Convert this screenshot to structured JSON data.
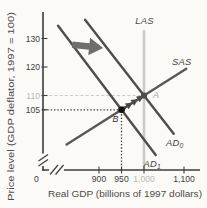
{
  "chart_data": {
    "type": "line",
    "title": "",
    "xlabel": "Real GDP (billions of 1997 dollars)",
    "ylabel": "Price level (GDP deflator, 1997 = 100)",
    "x_axis": {
      "origin_label": "0",
      "has_break": true,
      "ticks": [
        {
          "label": "900",
          "value": 900,
          "color": "#403f3d"
        },
        {
          "label": "950",
          "value": 950,
          "color": "#403f3d"
        },
        {
          "label": "1,000",
          "value": 1000,
          "color": "#b8bab2"
        },
        {
          "label": "1,100",
          "value": 1100,
          "color": "#403f3d"
        }
      ]
    },
    "y_axis": {
      "has_break": true,
      "ticks": [
        {
          "label": "130",
          "value": 130,
          "color": "#403f3d"
        },
        {
          "label": "120",
          "value": 120,
          "color": "#403f3d"
        },
        {
          "label": "110",
          "value": 110,
          "color": "#b8bab2"
        },
        {
          "label": "105",
          "value": 105,
          "color": "#403f3d"
        }
      ]
    },
    "curves": [
      {
        "name": "LAS",
        "label": "LAS",
        "sub": "",
        "from": [
          1000,
          84.2
        ],
        "to": [
          1000,
          132.6
        ],
        "color": "#c9ccc4",
        "width": 2.6,
        "label_color": "#4b4b49"
      },
      {
        "name": "AD0",
        "label": "AD",
        "sub": "0",
        "from": [
          869,
          136.6
        ],
        "to": [
          1066,
          96.6
        ],
        "color": "#4e4e4c",
        "width": 2.4,
        "label_color": "#454543"
      },
      {
        "name": "AD1",
        "label": "AD",
        "sub": "1",
        "from": [
          809,
          134.5
        ],
        "to": [
          1026,
          89.1
        ],
        "color": "#4e4e4c",
        "width": 2.4,
        "label_color": "#454543"
      },
      {
        "name": "SAS",
        "label": "SAS",
        "sub": "",
        "from": [
          828,
          92.8
        ],
        "to": [
          1094,
          119.4
        ],
        "color": "#585856",
        "width": 2.4,
        "label_color": "#454543"
      }
    ],
    "points": [
      {
        "name": "A",
        "label": "A",
        "x": 1000,
        "y": 110,
        "dot_color": "#4c4c4a",
        "label_color": "#a3a49d"
      },
      {
        "name": "B",
        "label": "B",
        "x": 950,
        "y": 105,
        "dot_color": "#121210",
        "label_color": "#343432"
      }
    ],
    "guides": [
      {
        "name": "price-110-dashed",
        "style": "dashed",
        "color": "#c9ccc4",
        "from": [
          778,
          110
        ],
        "to": [
          1000,
          110
        ]
      },
      {
        "name": "price-105-dotted",
        "style": "dotted",
        "color": "#2e2e2c",
        "from": [
          778,
          105
        ],
        "to": [
          950,
          105
        ]
      },
      {
        "name": "gdp-950-dotted",
        "style": "dotted",
        "color": "#2e2e2c",
        "from": [
          950,
          84.4
        ],
        "to": [
          950,
          105
        ]
      }
    ],
    "shift_arrow": {
      "direction": "right",
      "at": [
        876,
        127.2
      ],
      "color": "#6e6e6c"
    },
    "adjustment_arrows": {
      "along": "SAS",
      "from_x": 955,
      "to_x": 992,
      "count": 4,
      "color": "#4a4a48"
    },
    "axis_color": "#3d3d3b",
    "x_range_shown": [
      900,
      1100
    ],
    "y_range_shown": [
      105,
      130
    ],
    "grid": "off",
    "legend": "none"
  }
}
